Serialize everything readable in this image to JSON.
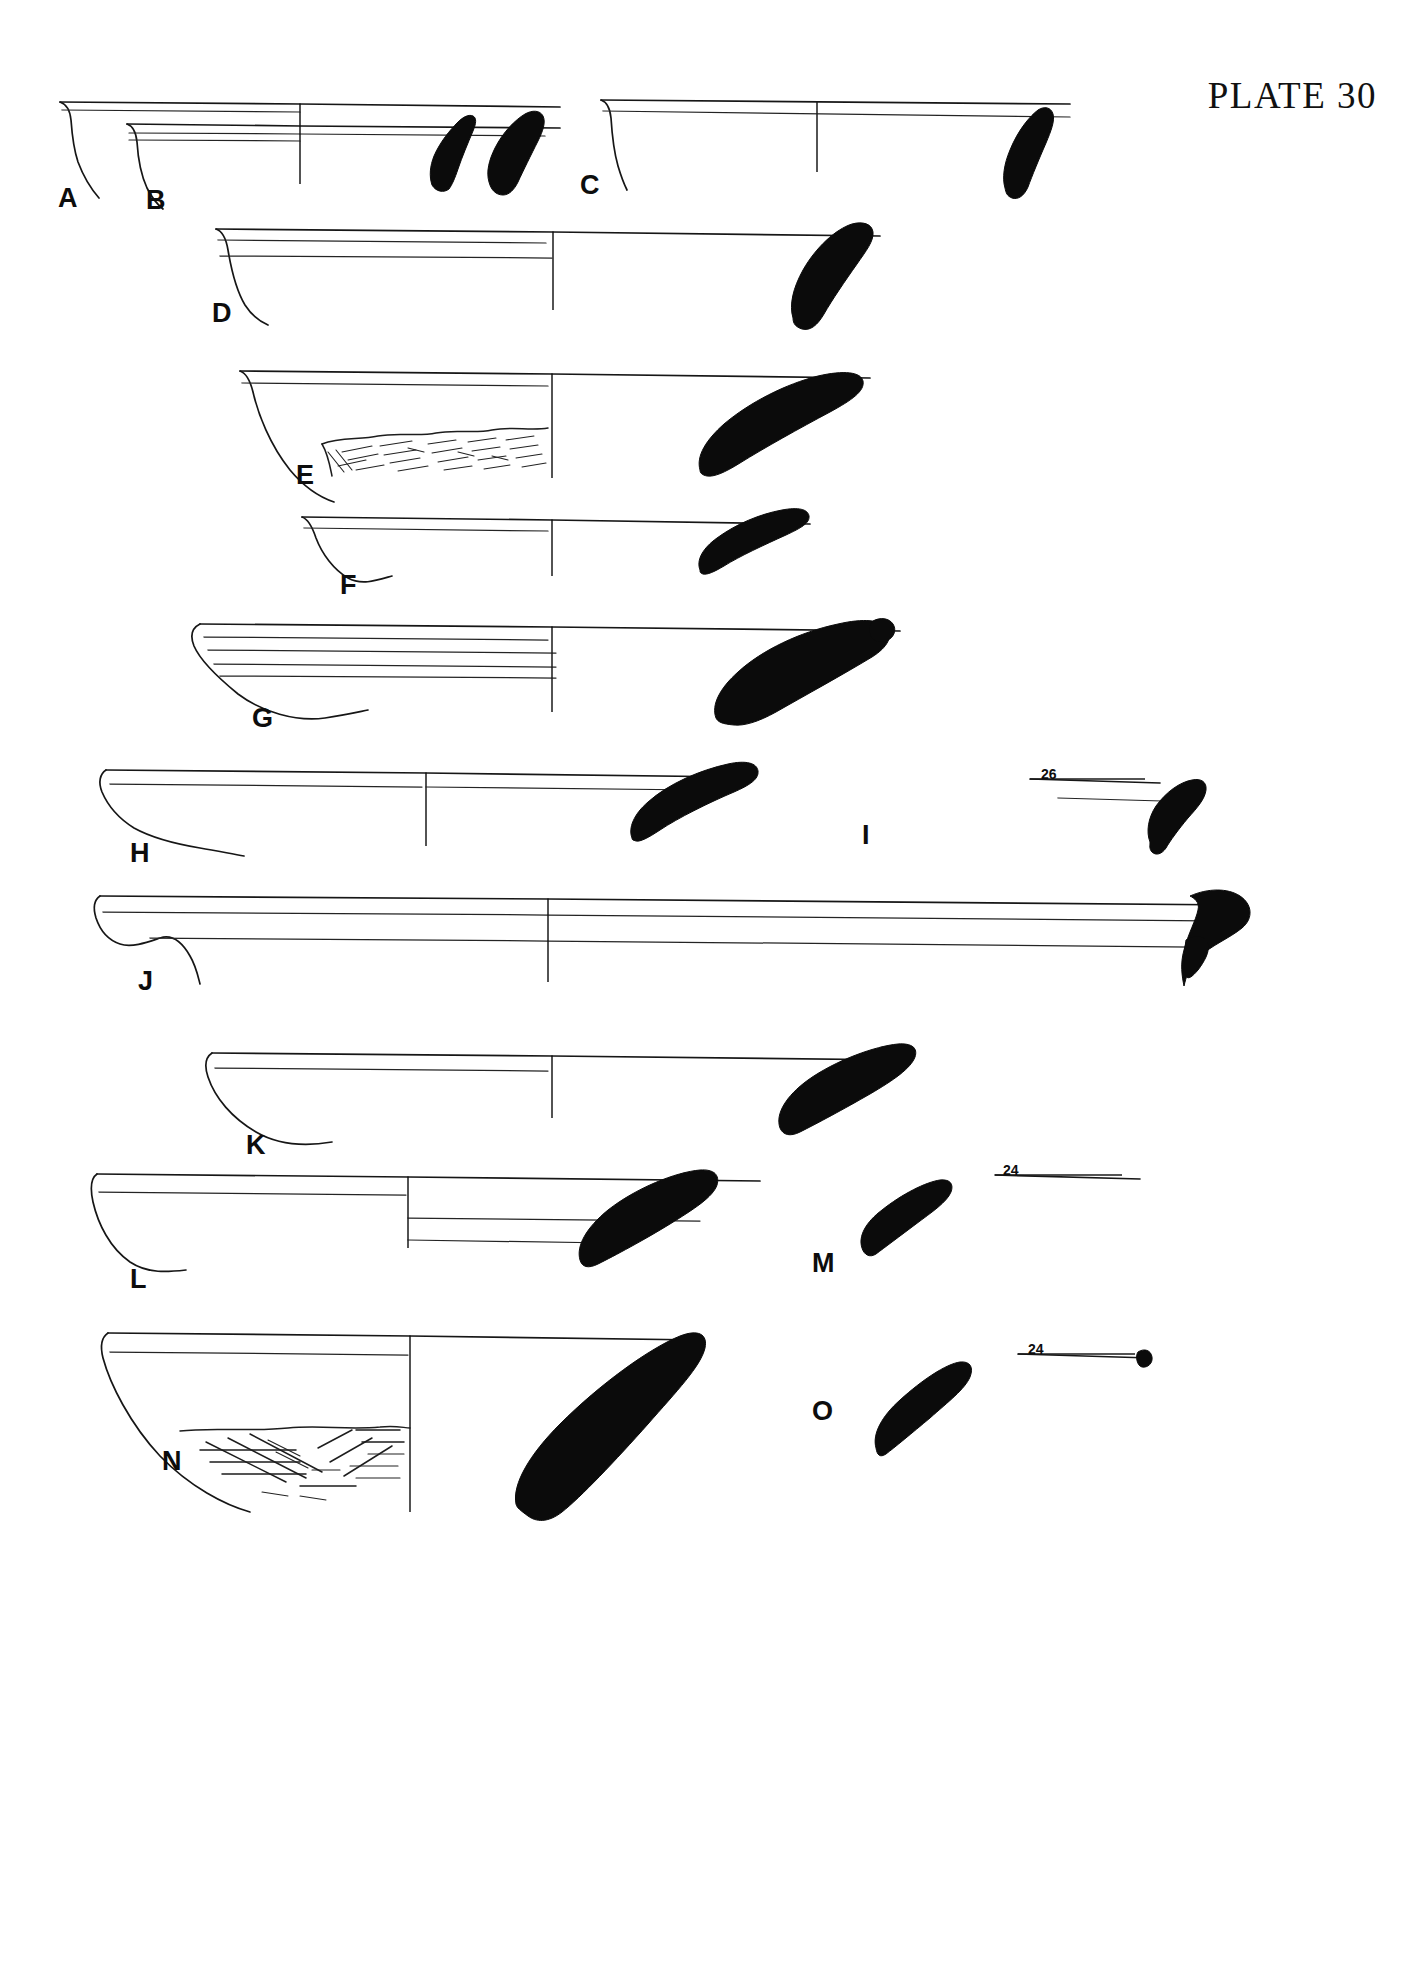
{
  "plate": {
    "title": "PLATE 30",
    "page_background": "#ffffff",
    "ink_color": "#111111",
    "sherd_fill": "#0b0b0b"
  },
  "figures": [
    {
      "id": "A",
      "label": "A",
      "label_x": 58,
      "label_y": 185,
      "diameter_label": null,
      "decoration": false,
      "description": "open bowl rim profile, simple rounded rim"
    },
    {
      "id": "B",
      "label": "B",
      "label_x": 146,
      "label_y": 187,
      "diameter_label": null,
      "decoration": false,
      "description": "open bowl rim profile with interior ridge line"
    },
    {
      "id": "C",
      "label": "C",
      "label_x": 580,
      "label_y": 172,
      "diameter_label": null,
      "decoration": false,
      "description": "shallow platter rim profile"
    },
    {
      "id": "D",
      "label": "D",
      "label_x": 212,
      "label_y": 300,
      "diameter_label": null,
      "decoration": false,
      "description": "bowl with thickened rim and interior band"
    },
    {
      "id": "E",
      "label": "E",
      "label_x": 296,
      "label_y": 462,
      "diameter_label": null,
      "decoration": true,
      "description": "bowl with eroded / hatched surface treatment on lower body"
    },
    {
      "id": "F",
      "label": "F",
      "label_x": 340,
      "label_y": 572,
      "diameter_label": null,
      "decoration": false,
      "description": "small shallow bowl rim profile"
    },
    {
      "id": "G",
      "label": "G",
      "label_x": 252,
      "label_y": 705,
      "diameter_label": null,
      "decoration": false,
      "description": "bowl with flaring rim and interior grooves"
    },
    {
      "id": "H",
      "label": "H",
      "label_x": 130,
      "label_y": 840,
      "diameter_label": null,
      "decoration": false,
      "description": "carinated bowl rim profile"
    },
    {
      "id": "I",
      "label": "I",
      "label_x": 862,
      "label_y": 822,
      "diameter_label": "26",
      "decoration": false,
      "description": "small rim fragment with diameter scale marker"
    },
    {
      "id": "J",
      "label": "J",
      "label_x": 138,
      "label_y": 968,
      "diameter_label": null,
      "decoration": false,
      "description": "large shallow platter with everted rim"
    },
    {
      "id": "K",
      "label": "K",
      "label_x": 246,
      "label_y": 1132,
      "diameter_label": null,
      "decoration": false,
      "description": "large open bowl rim profile"
    },
    {
      "id": "L",
      "label": "L",
      "label_x": 130,
      "label_y": 1266,
      "diameter_label": null,
      "decoration": false,
      "description": "bowl with straight wall and interior ledge"
    },
    {
      "id": "M",
      "label": "M",
      "label_x": 812,
      "label_y": 1250,
      "diameter_label": "24",
      "decoration": false,
      "description": "small rim fragment with diameter scale marker"
    },
    {
      "id": "N",
      "label": "N",
      "label_x": 162,
      "label_y": 1858,
      "diameter_label": null,
      "decoration": true,
      "description": "bowl with incised cross-hatched decoration on lower body"
    },
    {
      "id": "O",
      "label": "O",
      "label_x": 812,
      "label_y": 1430,
      "diameter_label": "24",
      "decoration": false,
      "description": "small rim fragment with diameter scale marker"
    }
  ],
  "diameter_markers": [
    {
      "for": "I",
      "value": "26",
      "x": 1041,
      "y": 767
    },
    {
      "for": "M",
      "value": "24",
      "x": 1003,
      "y": 1163
    },
    {
      "for": "O",
      "value": "24",
      "x": 1028,
      "y": 1344
    }
  ]
}
